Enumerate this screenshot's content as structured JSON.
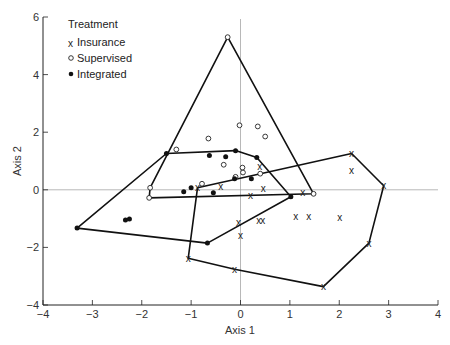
{
  "chart_data": {
    "type": "scatter",
    "title": "",
    "xlabel": "Axis 1",
    "ylabel": "Axis 2",
    "xlim": [
      -4,
      4
    ],
    "ylim": [
      -4,
      6
    ],
    "xticks": [
      -4,
      -3,
      -2,
      -1,
      0,
      1,
      2,
      3,
      4
    ],
    "yticks": [
      -4,
      -2,
      0,
      2,
      4,
      6
    ],
    "grid": false,
    "reference_lines": {
      "x": 0,
      "y": 0
    },
    "legend": {
      "title": "Treatment",
      "position": "upper-left",
      "entries": [
        {
          "marker": "x",
          "label": "Insurance"
        },
        {
          "marker": "open-circle",
          "label": "Supervised"
        },
        {
          "marker": "filled-circle",
          "label": "Integrated"
        }
      ]
    },
    "series": [
      {
        "name": "Insurance",
        "marker": "x",
        "points": [
          [
            -0.87,
            0.07
          ],
          [
            2.25,
            1.26
          ],
          [
            2.9,
            0.14
          ],
          [
            2.6,
            -1.85
          ],
          [
            1.68,
            -3.36
          ],
          [
            -0.12,
            -2.76
          ],
          [
            -1.06,
            -2.38
          ],
          [
            0.39,
            0.8
          ],
          [
            0.46,
            0.04
          ],
          [
            0.2,
            -0.2
          ],
          [
            -0.4,
            0.1
          ],
          [
            1.26,
            -0.1
          ],
          [
            2.25,
            0.66
          ],
          [
            -0.04,
            -1.15
          ],
          [
            0.0,
            -1.6
          ],
          [
            0.37,
            -1.08
          ],
          [
            0.45,
            -1.08
          ],
          [
            1.12,
            -0.91
          ],
          [
            1.38,
            -0.91
          ],
          [
            2.01,
            -0.95
          ]
        ],
        "hull": [
          [
            -0.87,
            0.07
          ],
          [
            2.25,
            1.26
          ],
          [
            2.9,
            0.14
          ],
          [
            2.6,
            -1.85
          ],
          [
            1.68,
            -3.36
          ],
          [
            -0.12,
            -2.76
          ],
          [
            -1.06,
            -2.38
          ]
        ]
      },
      {
        "name": "Supervised",
        "marker": "open-circle",
        "points": [
          [
            -0.26,
            5.3
          ],
          [
            1.48,
            -0.14
          ],
          [
            -1.85,
            -0.28
          ],
          [
            -1.83,
            0.07
          ],
          [
            -1.3,
            1.4
          ],
          [
            -0.65,
            1.78
          ],
          [
            -0.02,
            2.24
          ],
          [
            0.35,
            2.2
          ],
          [
            0.5,
            1.85
          ],
          [
            -0.34,
            0.87
          ],
          [
            0.04,
            0.77
          ],
          [
            0.4,
            0.56
          ],
          [
            -0.78,
            0.21
          ],
          [
            -0.1,
            0.45
          ],
          [
            0.05,
            0.6
          ]
        ],
        "hull": [
          [
            -0.26,
            5.3
          ],
          [
            1.48,
            -0.14
          ],
          [
            -1.85,
            -0.28
          ],
          [
            -1.83,
            0.07
          ]
        ]
      },
      {
        "name": "Integrated",
        "marker": "filled-circle",
        "points": [
          [
            -3.31,
            -1.33
          ],
          [
            -1.5,
            1.26
          ],
          [
            -0.1,
            1.36
          ],
          [
            0.33,
            1.12
          ],
          [
            1.02,
            -0.24
          ],
          [
            -0.67,
            -1.85
          ],
          [
            -2.33,
            -1.05
          ],
          [
            -2.25,
            -1.01
          ],
          [
            -1.15,
            -0.07
          ],
          [
            -1.0,
            0.07
          ],
          [
            -0.63,
            1.19
          ],
          [
            -0.3,
            1.15
          ],
          [
            -0.55,
            -0.1
          ],
          [
            -0.12,
            0.38
          ],
          [
            0.22,
            0.38
          ]
        ],
        "hull": [
          [
            -3.31,
            -1.33
          ],
          [
            -1.5,
            1.26
          ],
          [
            -0.1,
            1.36
          ],
          [
            0.33,
            1.12
          ],
          [
            1.02,
            -0.24
          ],
          [
            -0.67,
            -1.85
          ]
        ]
      }
    ]
  }
}
